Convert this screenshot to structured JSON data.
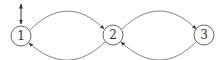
{
  "diagram": {
    "type": "state-transition",
    "nodes": [
      {
        "id": "1",
        "label": "1",
        "cx": 21,
        "cy": 36
      },
      {
        "id": "2",
        "label": "2",
        "cx": 113,
        "cy": 35
      },
      {
        "id": "3",
        "label": "3",
        "cx": 204,
        "cy": 35
      }
    ],
    "edges": [
      {
        "from": "1",
        "to": "2",
        "side": "top"
      },
      {
        "from": "2",
        "to": "1",
        "side": "bottom"
      },
      {
        "from": "2",
        "to": "3",
        "side": "top"
      },
      {
        "from": "3",
        "to": "2",
        "side": "bottom"
      }
    ],
    "initial_marker": {
      "node": "1",
      "style": "double-headed-arrow"
    },
    "colors": {
      "node_stroke": "#555555",
      "edge_stroke": "#777777",
      "text": "#333333"
    }
  }
}
